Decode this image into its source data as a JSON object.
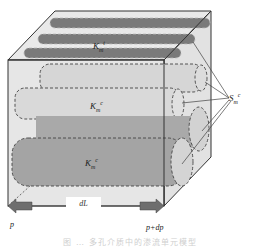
{
  "diagram": {
    "type": "3d-porous-medium-element",
    "labels": {
      "k_top": {
        "base": "K",
        "sub": "m",
        "sup": "t"
      },
      "k_mid": {
        "base": "K",
        "sub": "m",
        "sup": "c"
      },
      "k_bot": {
        "base": "K",
        "sub": "m",
        "sup": "c"
      },
      "s_right": {
        "base": "S",
        "sub": "m",
        "sup": "c"
      },
      "length": "dL",
      "pressure_in": "p",
      "pressure_out": "p+dp"
    },
    "caption": "图 … 多孔介质中的渗流单元模型",
    "colors": {
      "box_face": "#e6e6e6",
      "box_edge": "#333333",
      "dark_tube": "#7a7a7a",
      "light_tube": "#d8d8d8",
      "mid_tube": "#a9a9a9",
      "arrow": "#6e6e6e",
      "dash": "#444444"
    }
  }
}
